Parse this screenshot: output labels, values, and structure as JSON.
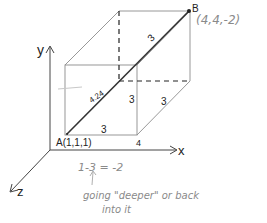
{
  "diagram": {
    "type": "3d-cube-diagonal",
    "axes": {
      "x": "x",
      "y": "y",
      "z": "z"
    },
    "points": {
      "A": {
        "name": "A",
        "label": "A(1,1,1)"
      },
      "B": {
        "name": "B",
        "label": "(4,4,-2)"
      }
    },
    "edge_labels": {
      "front_bottom": "3",
      "front_right": "3",
      "depth_bottom_right": "3",
      "diagonal_upper": "3",
      "diagonal_length": "4.24",
      "x_tick": "4"
    },
    "annotations": {
      "z_calc": "1-3 = -2",
      "note_line1": "going \"deeper\" or back",
      "note_line2": "into it"
    },
    "colors": {
      "edges": "#8c8c8c",
      "diagonal": "#333333",
      "pencil": "#9a9a9a"
    }
  }
}
